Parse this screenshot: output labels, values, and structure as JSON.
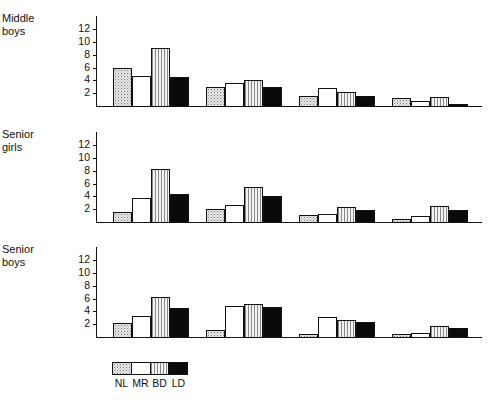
{
  "chart_data": {
    "type": "bar",
    "layout": "three vertically stacked grouped bar panels sharing one legend",
    "categories": [
      "Group 1",
      "Group 2",
      "Group 3",
      "Group 4"
    ],
    "legend": [
      "NL",
      "MR",
      "BD",
      "LD"
    ],
    "legend_position": "bottom-left",
    "yticks": [
      2,
      4,
      6,
      8,
      10,
      12
    ],
    "ylim": [
      0,
      14
    ],
    "grid": false,
    "xlabel": "",
    "ylabel": "",
    "panels": [
      {
        "title": "Middle\nboys",
        "series": [
          {
            "name": "NL",
            "values": [
              6.0,
              3.0,
              1.5,
              1.2
            ]
          },
          {
            "name": "MR",
            "values": [
              4.7,
              3.6,
              2.8,
              0.8
            ]
          },
          {
            "name": "BD",
            "values": [
              9.0,
              4.1,
              2.2,
              1.4
            ]
          },
          {
            "name": "LD",
            "values": [
              4.5,
              2.9,
              1.5,
              0.3
            ]
          }
        ]
      },
      {
        "title": "Senior\ngirls",
        "series": [
          {
            "name": "NL",
            "values": [
              1.5,
              2.0,
              1.1,
              0.5
            ]
          },
          {
            "name": "MR",
            "values": [
              3.7,
              2.6,
              1.3,
              0.9
            ]
          },
          {
            "name": "BD",
            "values": [
              8.3,
              5.4,
              2.3,
              2.5
            ]
          },
          {
            "name": "LD",
            "values": [
              4.4,
              4.1,
              1.9,
              1.9
            ]
          }
        ]
      },
      {
        "title": "Senior\nboys",
        "series": [
          {
            "name": "NL",
            "values": [
              2.2,
              1.1,
              0.5,
              0.4
            ]
          },
          {
            "name": "MR",
            "values": [
              3.3,
              4.9,
              3.2,
              0.7
            ]
          },
          {
            "name": "BD",
            "values": [
              6.3,
              5.2,
              2.7,
              1.7
            ]
          },
          {
            "name": "LD",
            "values": [
              4.6,
              4.7,
              2.3,
              1.4
            ]
          }
        ]
      }
    ]
  },
  "labels": {
    "panel0": "Middle\nboys",
    "panel1": "Senior\ngirls",
    "panel2": "Senior\nboys",
    "legend": [
      "NL",
      "MR",
      "BD",
      "LD"
    ],
    "ticks": [
      "2",
      "4",
      "6",
      "8",
      "10",
      "12"
    ]
  }
}
